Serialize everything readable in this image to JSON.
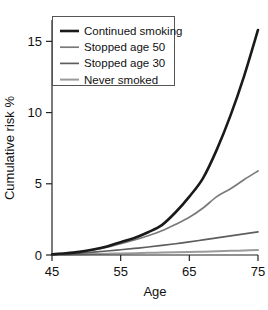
{
  "chart_data": {
    "type": "line",
    "title": "",
    "xlabel": "Age",
    "ylabel": "Cumulative risk %",
    "xlim": [
      45,
      75
    ],
    "ylim": [
      0,
      16.5
    ],
    "xticks": [
      45,
      55,
      65,
      75
    ],
    "yticks": [
      0,
      5,
      10,
      15
    ],
    "xtick_labels": [
      "45",
      "55",
      "65",
      "75"
    ],
    "ytick_labels": [
      "0",
      "5",
      "10",
      "15"
    ],
    "grid": false,
    "legend_position": "upper left",
    "x": [
      45,
      47,
      49,
      51,
      53,
      55,
      57,
      59,
      61,
      63,
      65,
      67,
      69,
      71,
      73,
      75
    ],
    "series": [
      {
        "name": "Continued smoking",
        "color": "#1a1a1a",
        "width": 2.6,
        "values": [
          0.05,
          0.12,
          0.22,
          0.38,
          0.6,
          0.9,
          1.2,
          1.6,
          2.1,
          3.0,
          4.1,
          5.4,
          7.4,
          9.8,
          12.6,
          15.8
        ]
      },
      {
        "name": "Stopped age 50",
        "color": "#7a7a7a",
        "width": 1.7,
        "values": [
          0.05,
          0.12,
          0.22,
          0.36,
          0.55,
          0.8,
          1.05,
          1.35,
          1.7,
          2.15,
          2.65,
          3.3,
          4.1,
          4.65,
          5.3,
          5.9
        ]
      },
      {
        "name": "Stopped age 30",
        "color": "#5e5e5e",
        "width": 1.7,
        "values": [
          0.04,
          0.08,
          0.13,
          0.2,
          0.28,
          0.37,
          0.46,
          0.56,
          0.67,
          0.79,
          0.92,
          1.06,
          1.2,
          1.34,
          1.48,
          1.62
        ]
      },
      {
        "name": "Never smoked",
        "color": "#9a9a9a",
        "width": 2.0,
        "values": [
          0.02,
          0.04,
          0.055,
          0.07,
          0.09,
          0.11,
          0.13,
          0.15,
          0.17,
          0.19,
          0.21,
          0.235,
          0.26,
          0.29,
          0.32,
          0.35
        ]
      }
    ]
  },
  "legend": {
    "items": [
      {
        "label": "Continued smoking"
      },
      {
        "label": "Stopped age 50"
      },
      {
        "label": "Stopped age 30"
      },
      {
        "label": "Never smoked"
      }
    ]
  },
  "axes": {
    "x_title": "Age",
    "y_title": "Cumulative risk %"
  }
}
